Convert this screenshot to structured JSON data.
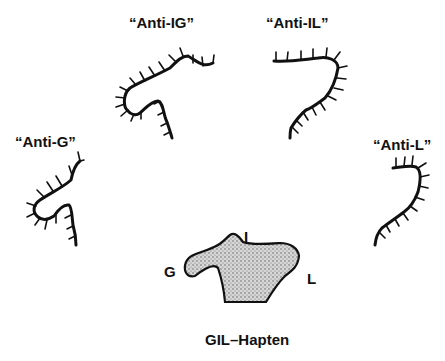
{
  "figure": {
    "antibodies": [
      {
        "id": "anti-ig",
        "label": "“Anti-IG”"
      },
      {
        "id": "anti-il",
        "label": "“Anti-IL”"
      },
      {
        "id": "anti-g",
        "label": "“Anti-G”"
      },
      {
        "id": "anti-l",
        "label": "“Anti-L”"
      }
    ],
    "hapten": {
      "name": "GIL–Hapten",
      "sites": {
        "G": "G",
        "I": "I",
        "L": "L"
      },
      "fill_color": "#bdbdbd",
      "outline_color": "#111111"
    },
    "line_color": "#111111"
  }
}
